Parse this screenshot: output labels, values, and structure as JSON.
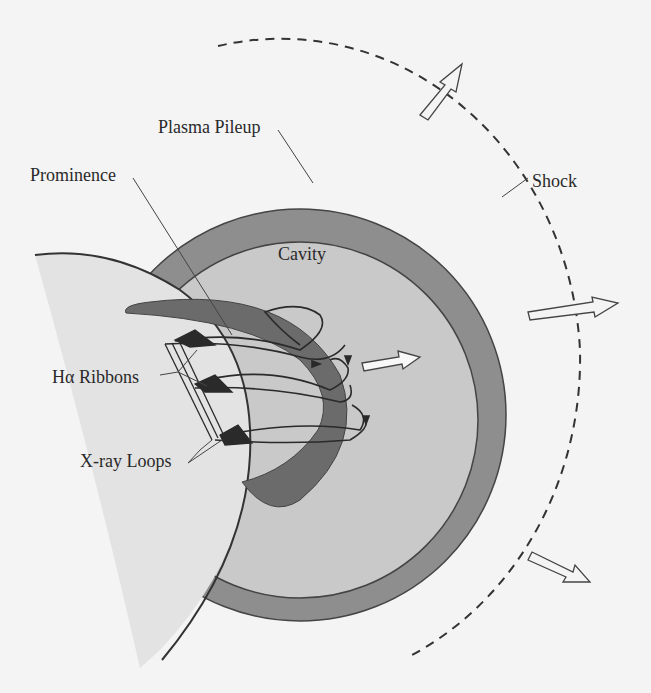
{
  "diagram": {
    "type": "labeled-schematic",
    "labels": {
      "plasma_pileup": "Plasma Pileup",
      "prominence": "Prominence",
      "cavity": "Cavity",
      "shock": "Shock",
      "ha_ribbons": "Hα Ribbons",
      "xray_loops": "X-ray Loops"
    },
    "regions": [
      {
        "name": "Plasma Pileup",
        "fill": "#8e8e8e"
      },
      {
        "name": "Cavity",
        "fill": "#c9c9c9"
      },
      {
        "name": "Prominence",
        "fill": "#6b6b6b"
      },
      {
        "name": "Sun",
        "fill": "#e3e3e3"
      },
      {
        "name": "Shock",
        "style": "dashed line"
      }
    ],
    "arrows": [
      {
        "location": "shock-top",
        "direction": "up-right"
      },
      {
        "location": "shock-right",
        "direction": "right"
      },
      {
        "location": "shock-bottom",
        "direction": "down-right"
      },
      {
        "location": "cavity-center",
        "direction": "right"
      }
    ],
    "colors": {
      "background": "#f4f4f4",
      "sun": "#e3e3e3",
      "pileup": "#8e8e8e",
      "cavity": "#c9c9c9",
      "prominence": "#6b6b6b",
      "stroke": "#333333"
    }
  }
}
